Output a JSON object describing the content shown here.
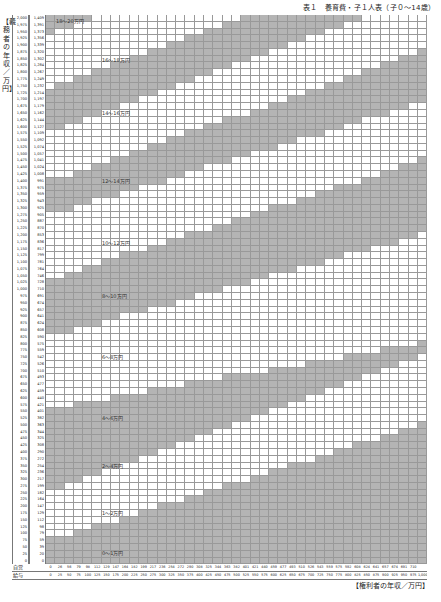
{
  "title": "表１　養育費・子１人表（子０～14歳）",
  "y_axis_label": "【義務者の年収／万円】",
  "x_axis_label": "【権利者の年収／万円】",
  "row_header": {
    "self_employed": "自営",
    "salaried": "給与"
  },
  "chart_data": {
    "type": "heatmap",
    "title": "表１　養育費・子１人表（子０～14歳）",
    "xlabel": "権利者の年収／万円",
    "ylabel": "義務者の年収／万円",
    "x_salaried": [
      0,
      25,
      50,
      75,
      100,
      125,
      150,
      175,
      200,
      225,
      250,
      275,
      300,
      325,
      350,
      375,
      400,
      425,
      450,
      475,
      500,
      525,
      550,
      575,
      600,
      625,
      650,
      675,
      700,
      725,
      750,
      775,
      800,
      825,
      850,
      875,
      900,
      925,
      950,
      975,
      1000
    ],
    "x_self_employed": [
      0,
      26,
      56,
      79,
      98,
      112,
      129,
      147,
      164,
      182,
      199,
      217,
      236,
      254,
      272,
      290,
      308,
      325,
      344,
      363,
      382,
      401,
      421,
      440,
      459,
      477,
      493,
      510,
      526,
      543,
      559,
      575,
      592,
      608,
      624,
      641,
      657,
      674,
      691,
      710,
      null
    ],
    "y_salaried": [
      2000,
      1975,
      1950,
      1925,
      1900,
      1875,
      1850,
      1825,
      1800,
      1775,
      1750,
      1725,
      1700,
      1675,
      1650,
      1625,
      1600,
      1575,
      1550,
      1525,
      1500,
      1475,
      1450,
      1425,
      1400,
      1375,
      1350,
      1325,
      1300,
      1275,
      1250,
      1225,
      1200,
      1175,
      1150,
      1125,
      1100,
      1075,
      1050,
      1025,
      1000,
      975,
      950,
      925,
      900,
      875,
      850,
      825,
      800,
      775,
      750,
      725,
      700,
      675,
      650,
      625,
      600,
      575,
      550,
      525,
      500,
      475,
      450,
      425,
      400,
      375,
      350,
      325,
      300,
      275,
      250,
      225,
      200,
      175,
      150,
      125,
      100,
      75,
      50,
      25,
      0
    ],
    "y_self_employed": [
      1409,
      1391,
      1373,
      1356,
      1339,
      1320,
      1302,
      1284,
      1267,
      1249,
      1232,
      1214,
      1197,
      1179,
      1162,
      1144,
      1127,
      1109,
      1092,
      1074,
      1057,
      1041,
      1024,
      1008,
      991,
      975,
      959,
      943,
      925,
      905,
      887,
      870,
      853,
      836,
      817,
      799,
      781,
      764,
      746,
      728,
      710,
      691,
      674,
      657,
      641,
      624,
      608,
      590,
      575,
      559,
      542,
      526,
      510,
      493,
      477,
      459,
      440,
      421,
      401,
      382,
      363,
      344,
      325,
      308,
      290,
      272,
      254,
      236,
      217,
      199,
      182,
      164,
      147,
      129,
      112,
      98,
      79,
      59,
      39,
      20,
      0
    ],
    "bands": [
      {
        "label": "0～1万円",
        "shade": "gray"
      },
      {
        "label": "1～2万円",
        "shade": "white"
      },
      {
        "label": "2～4万円",
        "shade": "gray"
      },
      {
        "label": "4～6万円",
        "shade": "white"
      },
      {
        "label": "6～8万円",
        "shade": "gray"
      },
      {
        "label": "8～10万円",
        "shade": "white"
      },
      {
        "label": "10～12万円",
        "shade": "gray"
      },
      {
        "label": "12～14万円",
        "shade": "white"
      },
      {
        "label": "14～16万円",
        "shade": "gray"
      },
      {
        "label": "16～18万円",
        "shade": "white"
      },
      {
        "label": "18～20万円",
        "shade": "gray"
      }
    ],
    "boundaries_row_index_at_x0_and_x1000": [
      [
        77,
        60
      ],
      [
        70,
        50
      ],
      [
        57.5,
        48
      ],
      [
        47,
        32
      ],
      [
        38.5,
        21
      ],
      [
        29,
        12.5
      ],
      [
        24,
        5
      ],
      [
        16.5,
        -3
      ],
      [
        10.5,
        -10
      ],
      [
        2.3,
        -17
      ]
    ]
  },
  "band_label_positions": [
    {
      "text": "0～1万円",
      "x": 102,
      "y": 549
    },
    {
      "text": "1～2万円",
      "x": 102,
      "y": 509
    },
    {
      "text": "2～4万円",
      "x": 102,
      "y": 462
    },
    {
      "text": "4～6万円",
      "x": 102,
      "y": 414
    },
    {
      "text": "6～8万円",
      "x": 102,
      "y": 353
    },
    {
      "text": "8～10万円",
      "x": 102,
      "y": 292
    },
    {
      "text": "10～12万円",
      "x": 102,
      "y": 239
    },
    {
      "text": "12～14万円",
      "x": 102,
      "y": 177
    },
    {
      "text": "14～16万円",
      "x": 102,
      "y": 109
    },
    {
      "text": "16～18万円",
      "x": 102,
      "y": 56
    },
    {
      "text": "18～20万円",
      "x": 56,
      "y": 17
    }
  ]
}
